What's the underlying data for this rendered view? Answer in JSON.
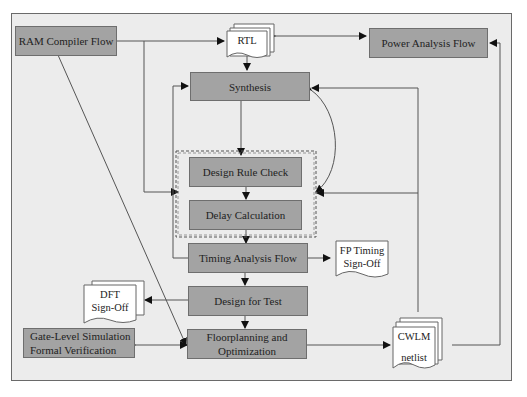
{
  "diagram": {
    "nodes": {
      "ram_compiler": "RAM Compiler Flow",
      "rtl": "RTL",
      "power_analysis": "Power Analysis Flow",
      "synthesis": "Synthesis",
      "design_rule_check": "Design Rule Check",
      "delay_calculation": "Delay Calculation",
      "timing_analysis": "Timing Analysis Flow",
      "fp_timing_signoff_line1": "FP Timing",
      "fp_timing_signoff_line2": "Sign-Off",
      "design_for_test": "Design for Test",
      "dft_signoff_line1": "DFT",
      "dft_signoff_line2": "Sign-Off",
      "gate_level_line1": "Gate-Level Simulation",
      "gate_level_line2": "Formal Verification",
      "floorplanning_line1": "Floorplanning and",
      "floorplanning_line2": "Optimization",
      "cwlm_line1": "CWLM",
      "cwlm_line2": "netlist"
    },
    "colors": {
      "process_fill": "#a3a3a3",
      "background": "#ececec",
      "document_fill": "#ffffff",
      "line": "#555555"
    }
  }
}
